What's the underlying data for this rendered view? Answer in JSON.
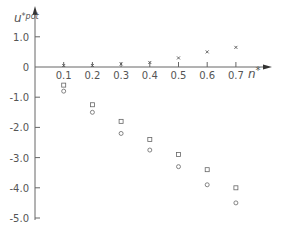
{
  "chart_data": {
    "type": "scatter",
    "title": "",
    "xlabel": "n*",
    "ylabel": "u*pot",
    "x_ticks": [
      "0.1",
      "0.2",
      "0.3",
      "0.4",
      "0.5",
      "0.6",
      "0.7"
    ],
    "y_ticks": [
      "1.0",
      "0",
      "-1.0",
      "-2.0",
      "-3.0",
      "-4.0",
      "-5.0"
    ],
    "xlim": [
      0,
      0.8
    ],
    "ylim": [
      -5.0,
      1.5
    ],
    "grid": false,
    "legend": null,
    "x": [
      0.1,
      0.2,
      0.3,
      0.4,
      0.5,
      0.6,
      0.7
    ],
    "series": [
      {
        "name": "cross",
        "marker": "x",
        "values": [
          0.05,
          0.05,
          0.1,
          0.15,
          0.3,
          0.5,
          0.65
        ]
      },
      {
        "name": "square",
        "marker": "square",
        "values": [
          -0.6,
          -1.25,
          -1.8,
          -2.4,
          -2.9,
          -3.4,
          -4.0
        ]
      },
      {
        "name": "circle",
        "marker": "circle",
        "values": [
          -0.8,
          -1.5,
          -2.2,
          -2.75,
          -3.3,
          -3.9,
          -4.5
        ]
      }
    ]
  },
  "labels": {
    "y_axis_main": "u",
    "y_axis_sup": "*pot",
    "x_axis_main": "n",
    "x_axis_sup": "*"
  }
}
